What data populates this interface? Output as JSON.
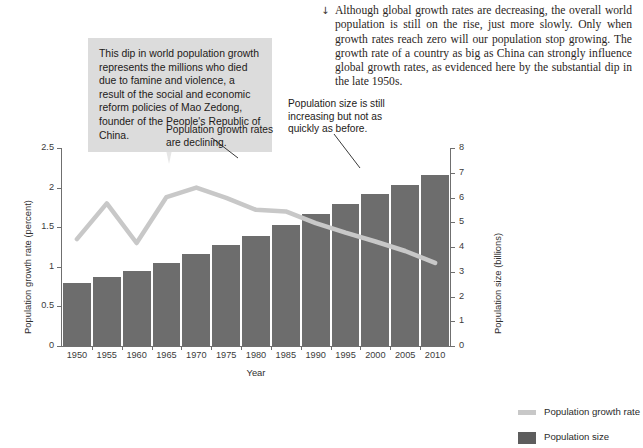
{
  "body_text": {
    "arrow_icon": "↓",
    "paragraph": "Although global growth rates are decreasing, the overall world population is still on the rise, just more slowly. Only when growth rates reach zero will our population stop growing. The growth rate of a country as big as China can strongly influence global growth rates, as evidenced here by the substantial dip in the late 1950s."
  },
  "callout": {
    "text": "This dip in world population growth represents the millions who died due to famine and violence, a result of the social and economic reform policies of Mao Zedong, founder of the People's Republic of China.",
    "background": "#dcdcdc"
  },
  "annotations": [
    {
      "text": "Population growth rates are declining."
    },
    {
      "text": "Population size is still increasing but not as quickly as before."
    }
  ],
  "legend": {
    "items": [
      {
        "label": "Population growth rate",
        "color": "#c8c8c8",
        "marker": "line"
      },
      {
        "label": "Population size",
        "color": "#5d5d5d",
        "marker": "box"
      }
    ]
  },
  "chart_data": {
    "type": "bar",
    "title": "",
    "xlabel": "Year",
    "ylabel": "Population growth rate (percent)",
    "y2label": "Population size (billions)",
    "categories": [
      "1950",
      "1955",
      "1960",
      "1965",
      "1970",
      "1975",
      "1980",
      "1985",
      "1990",
      "1995",
      "2000",
      "2005",
      "2010"
    ],
    "ylim": [
      0,
      2.5
    ],
    "yticks": [
      0,
      0.5,
      1,
      1.5,
      2,
      2.5
    ],
    "ytick_labels": [
      "0",
      "0.5",
      "1",
      "1.5",
      "2",
      "2.5"
    ],
    "y2lim": [
      0,
      8
    ],
    "y2ticks": [
      0,
      1,
      2,
      3,
      4,
      5,
      6,
      7,
      8
    ],
    "y2tick_labels": [
      "0",
      "1",
      "2",
      "3",
      "4",
      "5",
      "6",
      "7",
      "8"
    ],
    "grid": false,
    "legend_position": "right",
    "series": [
      {
        "name": "Population size",
        "type": "bar",
        "axis": "right",
        "unit": "billions",
        "color": "#6d6d6d",
        "values": [
          2.54,
          2.77,
          3.03,
          3.34,
          3.7,
          4.08,
          4.46,
          4.87,
          5.33,
          5.75,
          6.14,
          6.52,
          6.92
        ]
      },
      {
        "name": "Population growth rate",
        "type": "line",
        "axis": "left",
        "unit": "percent",
        "color": "#c8c8c8",
        "values": [
          1.35,
          1.8,
          1.3,
          1.88,
          2.0,
          1.87,
          1.72,
          1.7,
          1.55,
          1.43,
          1.32,
          1.2,
          1.05
        ]
      }
    ]
  }
}
